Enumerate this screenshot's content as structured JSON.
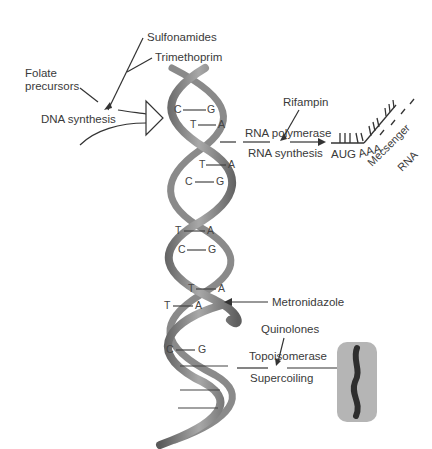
{
  "labels": {
    "sulfonamides": "Sulfonamides",
    "trimethoprim": "Trimethoprim",
    "folate_line1": "Folate",
    "folate_line2": "precursors",
    "dna_synthesis": "DNA synthesis",
    "rifampin": "Rifampin",
    "rna_polymerase": "RNA polymerase",
    "rna_synthesis": "RNA synthesis",
    "aug": "AUG",
    "aaa": "AAA",
    "messenger": "Mecsenger",
    "rna": "RNA",
    "metronidazole": "Metronidazole",
    "quinolones": "Quinolones",
    "topoisomerase": "Topoisomerase",
    "supercoiling": "Supercoiling"
  },
  "base_pairs": [
    {
      "left": "C",
      "right": "G"
    },
    {
      "left": "T",
      "right": "A"
    },
    {
      "left": "T",
      "right": "A"
    },
    {
      "left": "C",
      "right": "G"
    },
    {
      "left": "T",
      "right": "A"
    },
    {
      "left": "C",
      "right": "G"
    },
    {
      "left": "T",
      "right": "A"
    },
    {
      "left": "T",
      "right": "A"
    },
    {
      "left": "C",
      "right": "G"
    }
  ],
  "colors": {
    "helix": "#7a7a7a",
    "line": "#333333",
    "capsule": "#b5b5b5",
    "chromosome": "#3a3a3a"
  }
}
